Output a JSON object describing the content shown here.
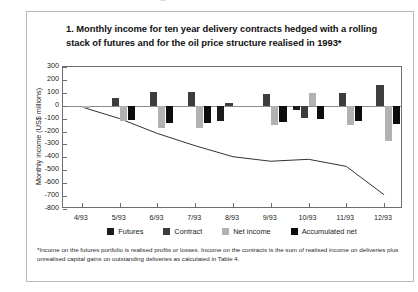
{
  "bleed": {
    "top_partial_text": "· _ · · · · · · · · ·"
  },
  "figure": {
    "title": "1. Monthly income for ten year delivery contracts hedged with a rolling stack of futures and for the oil price structure realised in 1993*",
    "footnote": "*Income on the futures portfolio is realised profits or losses. Income on the contracts is the sum of realised income on deliveries plus unrealised capital gains on outstanding deliveries as calculated in Table 4."
  },
  "colors": {
    "futures": "#1b1b1b",
    "contract": "#3d3d3d",
    "net_income": "#b2b2b2",
    "accumulated_net": "#0d0d0d",
    "axis": "#6d6d6d",
    "zero_line": "#8c8c8c",
    "frame": "#b9b9b9"
  },
  "chart_data": {
    "type": "bar",
    "title": "1. Monthly income for ten year delivery contracts hedged with a rolling stack of futures and for the oil price structure realised in 1993*",
    "xlabel": "",
    "ylabel": "Monthly income (US$ millions)",
    "ylim": [
      -800,
      300
    ],
    "ytick_step": 100,
    "yticks": [
      300,
      200,
      100,
      0,
      -100,
      -200,
      -300,
      -400,
      -500,
      -600,
      -700,
      -800
    ],
    "grid": false,
    "legend_position": "bottom",
    "categories": [
      "4/93",
      "5/93",
      "6/93",
      "7/93",
      "8/93",
      "9/93",
      "10/93",
      "11/93",
      "12/93"
    ],
    "series": [
      {
        "name": "Futures",
        "type": "bar",
        "color": "#1b1b1b",
        "values": [
          0,
          0,
          0,
          0,
          -120,
          0,
          -30,
          0,
          0
        ]
      },
      {
        "name": "Contract",
        "type": "bar",
        "color": "#3d3d3d",
        "values": [
          0,
          60,
          110,
          105,
          20,
          90,
          -95,
          95,
          160
        ]
      },
      {
        "name": "Net income",
        "type": "bar",
        "color": "#b2b2b2",
        "values": [
          -20,
          -115,
          -175,
          -170,
          0,
          -150,
          100,
          -150,
          -275
        ]
      },
      {
        "name": "Accumulated net",
        "type": "bar",
        "color": "#0d0d0d",
        "values": [
          0,
          -110,
          -130,
          -130,
          0,
          -125,
          -105,
          -120,
          -145
        ]
      },
      {
        "name": "Accumulated net (line)",
        "type": "line",
        "color": "#333333",
        "values": [
          -10,
          -100,
          -215,
          -310,
          -395,
          -430,
          -415,
          -470,
          -690
        ]
      }
    ]
  },
  "legend": {
    "items": [
      {
        "label": "Futures",
        "swatch": "#1b1b1b"
      },
      {
        "label": "Contract",
        "swatch": "#3d3d3d"
      },
      {
        "label": "Net income",
        "swatch": "#b2b2b2"
      },
      {
        "label": "Accumulated net",
        "swatch": "#0d0d0d"
      }
    ]
  }
}
